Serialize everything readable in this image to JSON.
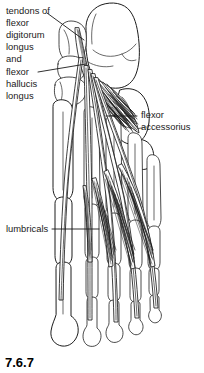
{
  "figure": {
    "caption": "7.6.7",
    "background_color": "#ffffff",
    "line_color": "#1c1c1c",
    "text_color": "#1a1a1a"
  },
  "labels": [
    {
      "id": "tendons-flexors",
      "text_lines": [
        "tendons of",
        "flexor",
        "digitorum",
        "longus",
        "and",
        "flexor",
        "hallucis",
        "longus"
      ],
      "position": "top-left",
      "leader_lines": 2
    },
    {
      "id": "flexor-accessorius",
      "text_lines": [
        "flexor",
        "accessorius"
      ],
      "position": "middle-right",
      "leader_lines": 1
    },
    {
      "id": "lumbricals",
      "text_lines": [
        "lumbricals"
      ],
      "position": "middle-left",
      "leader_lines": 1
    }
  ],
  "structures": [
    "calcaneus",
    "talus",
    "navicular",
    "cuneiforms",
    "cuboid",
    "metatarsals",
    "proximal phalanges",
    "middle phalanges",
    "distal phalanges",
    "flexor digitorum longus tendons",
    "flexor hallucis longus tendon",
    "flexor accessorius muscle",
    "lumbrical muscles"
  ]
}
